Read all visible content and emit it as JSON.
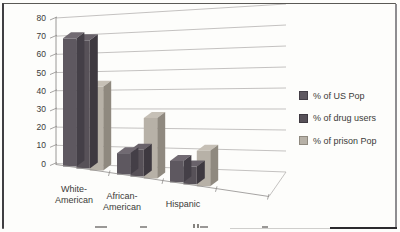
{
  "frame": {
    "bg": "#fdfdfb",
    "border_color": "#403f42"
  },
  "chart_data": {
    "type": "bar",
    "variant": "3d-clustered-column",
    "title": "",
    "xlabel": "",
    "ylabel": "",
    "categories": [
      "White-American",
      "African-American",
      "Hispanic"
    ],
    "series": [
      {
        "name": "% of US Pop",
        "values": [
          72,
          12,
          12
        ],
        "front": "#5e5860",
        "side": "#443f47",
        "top": "#716a72"
      },
      {
        "name": "% of drug users",
        "values": [
          72,
          15,
          10
        ],
        "front": "#575158",
        "side": "#3e3940",
        "top": "#69626a"
      },
      {
        "name": "% of prison Pop",
        "values": [
          47,
          34,
          20
        ],
        "front": "#b7b1a7",
        "side": "#8f897f",
        "top": "#c6c0b6"
      }
    ],
    "ylim": [
      0,
      80
    ],
    "yticks": [
      0,
      10,
      20,
      30,
      40,
      50,
      60,
      70,
      80
    ],
    "grid": true,
    "legend_position": "right",
    "gridline_color": "#b5b3b1",
    "axis_color": "#8f8d8b",
    "label_color": "#3b3a38"
  },
  "category_display": [
    {
      "lines": [
        "White-",
        "American"
      ]
    },
    {
      "lines": [
        "African-",
        "American"
      ]
    },
    {
      "lines": [
        "Hispanic",
        ""
      ]
    }
  ],
  "legend": {
    "items": [
      "% of US Pop",
      "% of drug users",
      "% of prison Pop"
    ]
  }
}
